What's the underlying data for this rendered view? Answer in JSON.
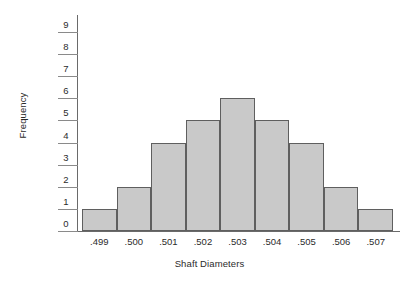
{
  "chart_data": {
    "type": "bar",
    "title": "",
    "subtitle": "",
    "xlabel": "Shaft Diameters",
    "ylabel": "Frequency",
    "categories": [
      ".499",
      ".500",
      ".501",
      ".502",
      ".503",
      ".504",
      ".505",
      ".506",
      ".507"
    ],
    "values": [
      1,
      2,
      4,
      5,
      6,
      5,
      4,
      2,
      1
    ],
    "series": [
      {
        "name": "Frequency",
        "values": [
          1,
          2,
          4,
          5,
          6,
          5,
          4,
          2,
          1
        ]
      }
    ],
    "ylim": [
      0,
      9
    ],
    "xlim": [
      0,
      9
    ],
    "y_ticks": [
      "0",
      "1",
      "2",
      "3",
      "4",
      "5",
      "6",
      "7",
      "8",
      "9"
    ],
    "y_tick_values": [
      0,
      1,
      2,
      3,
      4,
      5,
      6,
      7,
      8,
      9
    ],
    "grid": false,
    "legend": null,
    "legend_position": "none",
    "annotations": [],
    "colors": {
      "bar_fill": "#c9c9c9",
      "bar_border": "#5f5f5f",
      "axis": "#6a6a6a",
      "tick": "#8a8a8a",
      "text": "#2b2b2b",
      "background": "#ffffff"
    }
  },
  "axes": {
    "y_title": "Frequency",
    "x_title": "Shaft Diameters"
  }
}
